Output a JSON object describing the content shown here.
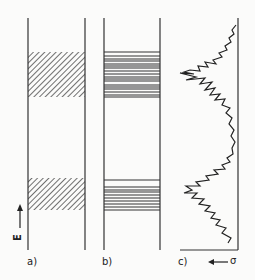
{
  "figure": {
    "panels": [
      {
        "id": "a",
        "label": "a)",
        "type": "hatched-bands",
        "bands": [
          [
            52,
            97
          ],
          [
            178,
            210
          ]
        ]
      },
      {
        "id": "b",
        "label": "b)",
        "type": "line-spectrum",
        "lines": [
          52,
          56,
          59,
          61,
          64,
          66,
          68,
          71,
          74,
          77,
          79,
          81,
          85,
          87,
          89,
          92,
          95,
          97,
          180,
          187,
          190,
          192,
          195,
          198,
          201,
          204,
          207,
          210
        ]
      },
      {
        "id": "c",
        "label": "c)",
        "type": "cross-section-curve",
        "axis_label": "σ",
        "arrow": "←"
      }
    ],
    "y_axis": {
      "label": "E",
      "arrow": "↑"
    }
  }
}
